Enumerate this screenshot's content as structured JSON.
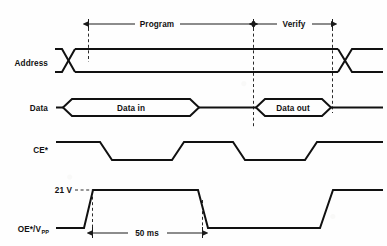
{
  "figure": {
    "type": "timing-diagram",
    "background_color": "#fefefe",
    "line_color": "#111111",
    "dash_color": "#2a2a2a"
  },
  "phases": [
    {
      "id": "program",
      "label": "Program",
      "start_x": 88,
      "end_x": 253
    },
    {
      "id": "verify",
      "label": "Verify",
      "start_x": 253,
      "end_x": 332
    }
  ],
  "signals": [
    {
      "id": "address",
      "label": "Address",
      "label_x": 48,
      "label_y": 63,
      "kind": "bus",
      "high_y": 49,
      "low_y": 72,
      "transitions": [
        68,
        345
      ],
      "start_x": 62,
      "end_x": 383
    },
    {
      "id": "data",
      "label": "Data",
      "label_x": 48,
      "label_y": 108,
      "kind": "bus-packet",
      "high_y": 99,
      "low_y": 116,
      "start_x": 62,
      "end_x": 383,
      "packets": [
        {
          "label": "Data in",
          "x1": 88,
          "x2": 197,
          "text_x": 143
        },
        {
          "label": "Data out",
          "x1": 263,
          "x2": 331,
          "text_x": 297
        }
      ]
    },
    {
      "id": "ce",
      "label": "CE*",
      "label_x": 48,
      "label_y": 150,
      "kind": "logic",
      "high_y": 140,
      "low_y": 159,
      "start_x": 62,
      "end_x": 383,
      "edges": [
        {
          "fall_start": 100,
          "fall_end": 112
        },
        {
          "rise_start": 153,
          "rise_end": 166
        },
        {
          "fall_start": 235,
          "fall_end": 248
        },
        {
          "rise_start": 297,
          "rise_end": 310
        }
      ]
    },
    {
      "id": "oe_vpp",
      "label": "OE*/V",
      "label_sub": "PP",
      "label_x": 48,
      "label_y": 229,
      "kind": "analog",
      "high_y": 190,
      "low_y": 228,
      "start_x": 62,
      "end_x": 383,
      "edges": [
        {
          "rise_start": 84,
          "rise_end": 93
        },
        {
          "fall_start": 198,
          "fall_end": 208
        },
        {
          "rise_start": 320,
          "rise_end": 333
        }
      ]
    }
  ],
  "annotations": {
    "voltage_marker": {
      "label": "21 V",
      "text_x": 70,
      "text_y": 191,
      "leader_x1": 74,
      "leader_x2": 92,
      "leader_y": 188
    },
    "duration_marker": {
      "label": "50 ms",
      "text_x": 145,
      "text_y": 235,
      "line_y": 232,
      "x1": 92,
      "x2": 202
    }
  },
  "dashed_guides": [
    {
      "id": "guide-program-start",
      "x": 88,
      "y1": 20,
      "y2": 62
    },
    {
      "id": "guide-program-end",
      "x": 253,
      "y1": 20,
      "y2": 128
    },
    {
      "id": "guide-verify-end",
      "x": 332,
      "y1": 20,
      "y2": 113
    },
    {
      "id": "guide-vpp-rise",
      "x": 92,
      "y1": 190,
      "y2": 234
    },
    {
      "id": "guide-vpp-fall",
      "x": 202,
      "y1": 200,
      "y2": 234
    }
  ]
}
